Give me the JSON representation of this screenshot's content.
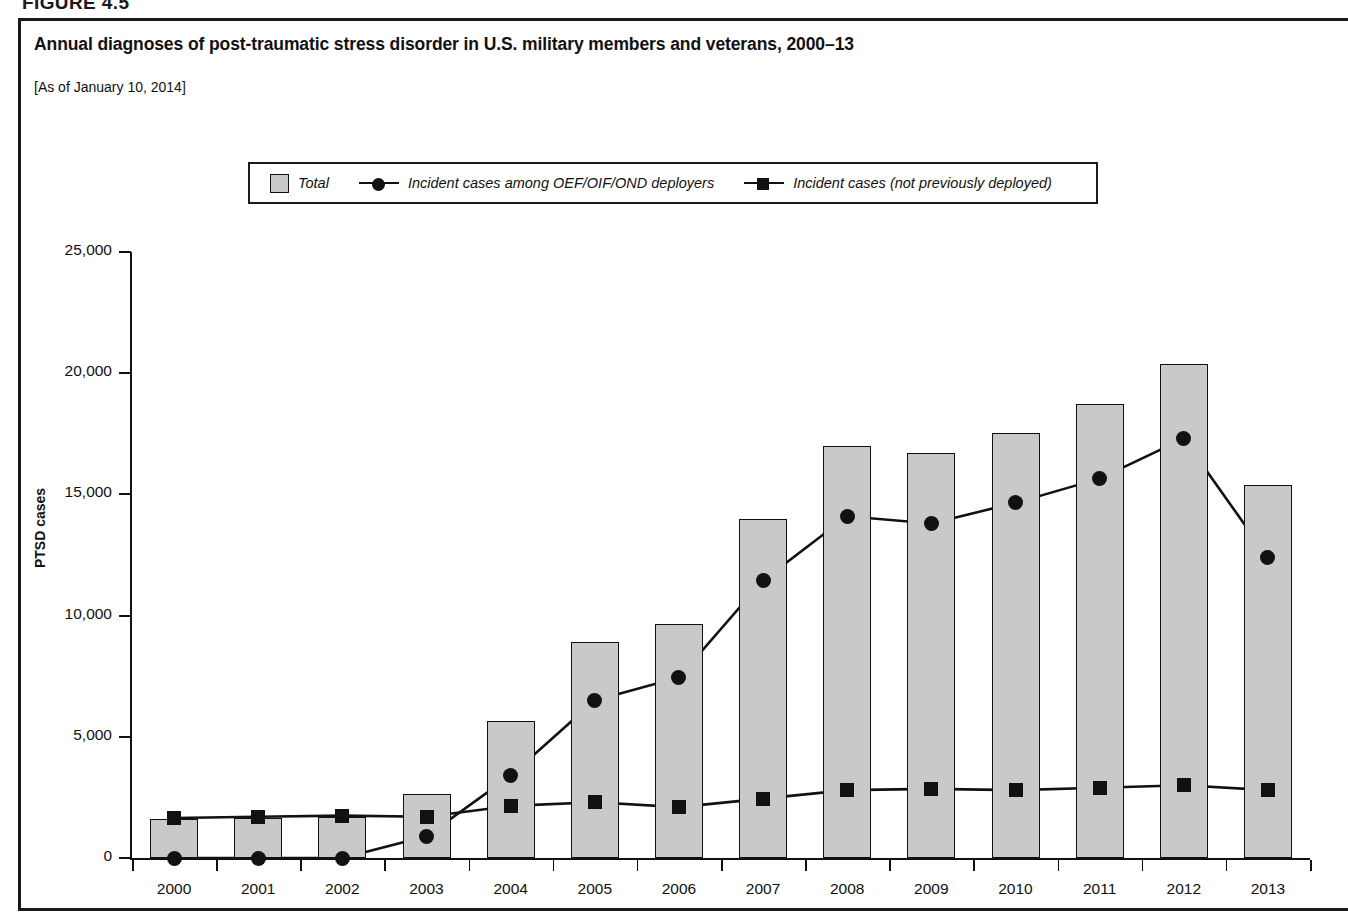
{
  "figure": {
    "label": "FIGURE 4.5"
  },
  "header": {
    "title": "Annual diagnoses of post-traumatic stress disorder in U.S. military members and veterans, 2000–13",
    "subtitle": "[As of January 10, 2014]"
  },
  "legend": {
    "position": "top-center",
    "items": [
      {
        "label": "Total",
        "marker": "filled-square-swatch",
        "color": "#c8c8c8"
      },
      {
        "label": "Incident cases among OEF/OIF/OND deployers",
        "marker": "line-circle",
        "color": "#111111"
      },
      {
        "label": "Incident cases (not previously deployed)",
        "marker": "line-square",
        "color": "#111111"
      }
    ]
  },
  "chart_data": {
    "type": "bar",
    "title": "Annual diagnoses of post-traumatic stress disorder in U.S. military members and veterans, 2000–13",
    "subtitle": "[As of January 10, 2014]",
    "xlabel": "",
    "ylabel": "PTSD cases",
    "categories": [
      "2000",
      "2001",
      "2002",
      "2003",
      "2004",
      "2005",
      "2006",
      "2007",
      "2008",
      "2009",
      "2010",
      "2011",
      "2012",
      "2013"
    ],
    "ylim": [
      0,
      25000
    ],
    "yticks": [
      0,
      5000,
      10000,
      15000,
      20000,
      25000
    ],
    "ytick_labels": [
      "0",
      "5,000",
      "10,000",
      "15,000",
      "20,000",
      "25,000"
    ],
    "grid": false,
    "series": [
      {
        "name": "Total",
        "type": "bar",
        "values": [
          1600,
          1650,
          1700,
          2650,
          5650,
          8900,
          9650,
          14000,
          17000,
          16700,
          17550,
          18750,
          20400,
          15400
        ]
      },
      {
        "name": "Incident cases among OEF/OIF/OND deployers",
        "type": "line",
        "marker": "circle",
        "values": [
          0,
          0,
          0,
          900,
          3400,
          6500,
          7450,
          11450,
          14100,
          13800,
          14650,
          15650,
          17300,
          12400
        ]
      },
      {
        "name": "Incident cases (not previously deployed)",
        "type": "line",
        "marker": "square",
        "values": [
          1650,
          1700,
          1750,
          1700,
          2150,
          2300,
          2100,
          2450,
          2800,
          2850,
          2800,
          2900,
          3000,
          2800
        ]
      }
    ]
  },
  "axis": {
    "y_title": "PTSD cases"
  },
  "colors": {
    "bar_fill": "#c9c9c9",
    "outline": "#111111",
    "background": "#ffffff"
  }
}
